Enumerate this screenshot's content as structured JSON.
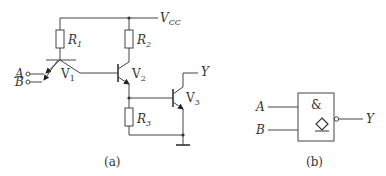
{
  "figure_a": {
    "caption": "(a)",
    "supply_label": "V",
    "supply_sub": "CC",
    "inputs": [
      {
        "label": "A"
      },
      {
        "label": "B"
      }
    ],
    "output_label": "Y",
    "resistors": [
      {
        "label": "R",
        "sub": "1"
      },
      {
        "label": "R",
        "sub": "2"
      },
      {
        "label": "R",
        "sub": "3"
      }
    ],
    "transistors": [
      {
        "label": "V",
        "sub": "1",
        "type": "multi-emitter NPN"
      },
      {
        "label": "V",
        "sub": "2",
        "type": "NPN"
      },
      {
        "label": "V",
        "sub": "3",
        "type": "NPN"
      }
    ]
  },
  "figure_b": {
    "caption": "(b)",
    "gate_symbol": "&",
    "open_collector_symbol": "◇",
    "inputs": [
      {
        "label": "A"
      },
      {
        "label": "B"
      }
    ],
    "output_label": "Y"
  }
}
